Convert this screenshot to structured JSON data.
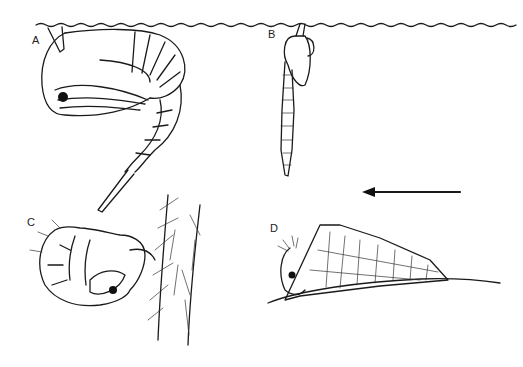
{
  "figure": {
    "panels": [
      {
        "id": "A",
        "label": "A",
        "subject": "pupa curled at water surface"
      },
      {
        "id": "B",
        "label": "B",
        "subject": "elongate pupa hanging from water surface"
      },
      {
        "id": "C",
        "label": "C",
        "subject": "pupa attached to hairy plant stem"
      },
      {
        "id": "D",
        "label": "D",
        "subject": "pupa in cocoon on substrate"
      }
    ],
    "arrow": {
      "direction": "left"
    },
    "colors": {
      "ink": "#1a1a1a",
      "background": "#ffffff"
    }
  }
}
